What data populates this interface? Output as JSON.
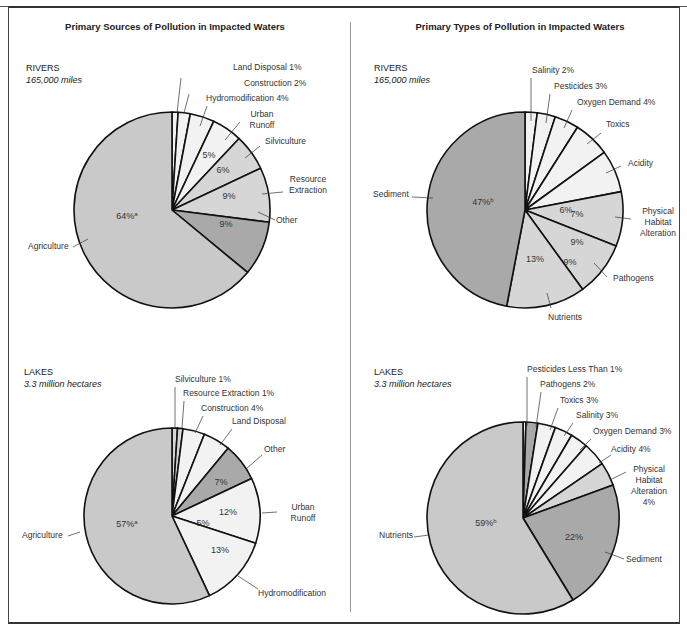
{
  "panels": {
    "left_title": "Primary Sources of Pollution in Impacted Waters",
    "right_title": "Primary Types of Pollution in Impacted Waters"
  },
  "sections": {
    "rivers_label": "RIVERS",
    "rivers_sub": "165,000 miles",
    "lakes_label": "LAKES",
    "lakes_sub": "3.3 million hectares"
  },
  "colors": {
    "light": "#f2f2f2",
    "medium": "#d6d6d6",
    "agri": "#c9c9c9",
    "dark": "#a9a9a9",
    "outline": "#111111"
  },
  "chart_data": [
    {
      "type": "pie",
      "title": "Primary Sources of Pollution in Impacted Waters — RIVERS (165,000 miles)",
      "categories": [
        "Land Disposal",
        "Construction",
        "Hydromodification",
        "Urban Runoff",
        "Silviculture",
        "Resource Extraction",
        "Other",
        "Agriculture"
      ],
      "values": [
        1,
        2,
        4,
        5,
        6,
        9,
        9,
        64
      ],
      "labels": [
        "Land Disposal 1%",
        "Construction 2%",
        "Hydromodification 4%",
        "Urban Runoff",
        "Silviculture",
        "Resource Extraction",
        "Other",
        "Agriculture"
      ],
      "inner_labels": [
        "",
        "",
        "",
        "5%",
        "6%",
        "9%",
        "9%",
        "64%a"
      ],
      "fills": [
        "light",
        "light",
        "light",
        "light",
        "medium",
        "medium",
        "dark",
        "agri"
      ]
    },
    {
      "type": "pie",
      "title": "Primary Types of Pollution in Impacted Waters — RIVERS (165,000 miles)",
      "categories": [
        "Salinity",
        "Pesticides",
        "Oxygen Demand",
        "Toxics",
        "Acidity",
        "Physical Habitat Alteration",
        "Pathogens",
        "Nutrients",
        "Sediment"
      ],
      "values": [
        2,
        3,
        4,
        6,
        7,
        9,
        9,
        13,
        47
      ],
      "labels": [
        "Salinity 2%",
        "Pesticides 3%",
        "Oxygen Demand 4%",
        "Toxics",
        "Acidity",
        "Physical Habitat Alteration",
        "Pathogens",
        "Nutrients",
        "Sediment"
      ],
      "inner_labels": [
        "",
        "",
        "",
        "6%",
        "7%",
        "9%",
        "9%",
        "13%",
        "47%b"
      ],
      "fills": [
        "light",
        "light",
        "light",
        "light",
        "light",
        "medium",
        "medium",
        "medium",
        "dark"
      ]
    },
    {
      "type": "pie",
      "title": "Primary Sources of Pollution in Impacted Waters — LAKES (3.3 million hectares)",
      "categories": [
        "Silviculture",
        "Resource Extraction",
        "Construction",
        "Land Disposal",
        "Other",
        "Urban Runoff",
        "Hydromodification",
        "Agriculture"
      ],
      "values": [
        1,
        1,
        4,
        5,
        7,
        12,
        13,
        57
      ],
      "labels": [
        "Silviculture 1%",
        "Resource Extraction 1%",
        "Construction 4%",
        "Land Disposal",
        "Other",
        "Urban Runoff",
        "Hydromodification",
        "Agriculture"
      ],
      "inner_labels": [
        "",
        "",
        "",
        "5%",
        "7%",
        "12%",
        "13%",
        "57%a"
      ],
      "fills": [
        "medium",
        "medium",
        "light",
        "light",
        "dark",
        "light",
        "light",
        "agri"
      ]
    },
    {
      "type": "pie",
      "title": "Primary Types of Pollution in Impacted Waters — LAKES (3.3 million hectares)",
      "categories": [
        "Pesticides",
        "Pathogens",
        "Toxics",
        "Salinity",
        "Oxygen Demand",
        "Acidity",
        "Physical Habitat Alteration",
        "Sediment",
        "Nutrients"
      ],
      "values": [
        0.5,
        2,
        3,
        3,
        3,
        4,
        4,
        22,
        59
      ],
      "labels": [
        "Pesticides Less Than 1%",
        "Pathogens 2%",
        "Toxics 3%",
        "Salinity 3%",
        "Oxygen Demand 3%",
        "Acidity 4%",
        "Physical Habitat Alteration 4%",
        "Sediment",
        "Nutrients"
      ],
      "inner_labels": [
        "",
        "",
        "",
        "",
        "",
        "",
        "",
        "22%",
        "59%b"
      ],
      "fills": [
        "light",
        "dark",
        "light",
        "light",
        "light",
        "light",
        "medium",
        "dark",
        "agri"
      ]
    }
  ]
}
